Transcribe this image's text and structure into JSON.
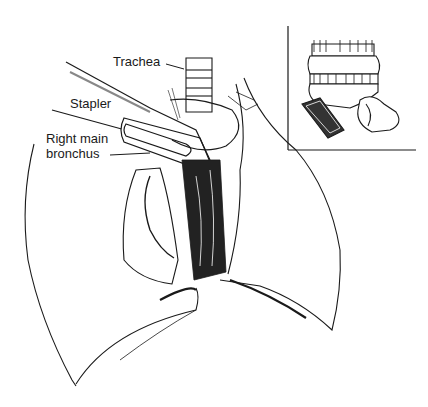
{
  "figure": {
    "type": "surgical-illustration",
    "labels": {
      "trachea": "Trachea",
      "stapler": "Stapler",
      "right_main_bronchus_line1": "Right main",
      "right_main_bronchus_line2": "bronchus"
    },
    "inset": {
      "description": "Stapled bronchial stump detail"
    },
    "colors": {
      "ink": "#1a1a1a",
      "background": "#ffffff"
    }
  }
}
